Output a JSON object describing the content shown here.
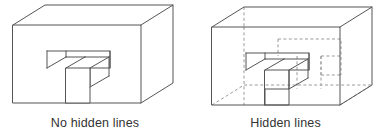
{
  "figure": {
    "title_visible": false,
    "panels": [
      {
        "id": "no-hidden",
        "caption": "No hidden lines",
        "style": "opaque solid model, hidden edges removed",
        "shows_hidden_edges": false
      },
      {
        "id": "hidden",
        "caption": "Hidden lines",
        "style": "transparent wireframe, obscured edges drawn dashed",
        "shows_hidden_edges": true
      }
    ]
  },
  "colors": {
    "background": "#ffffff",
    "visible_edge": "#555555",
    "hidden_edge": "#9a9a9a",
    "face_fill": "#ffffff",
    "caption_text": "#333333"
  },
  "geometry": {
    "object_description": "rectangular block in isometric-style oblique projection with a stepped rectangular notch cut into the front face",
    "projection": "oblique / cabinet, depth receding up and to the right",
    "depth_offset_x": 32,
    "depth_offset_y": -20,
    "block": {
      "front_left_x": 13,
      "front_right_x": 141,
      "front_top_y": 25,
      "front_bottom_y": 103
    },
    "notch": {
      "top_y": 51,
      "left_x": 47,
      "right_x": 110,
      "step_mid_x": 79,
      "step_top_y": 68,
      "step_bottom_y": 87
    }
  }
}
